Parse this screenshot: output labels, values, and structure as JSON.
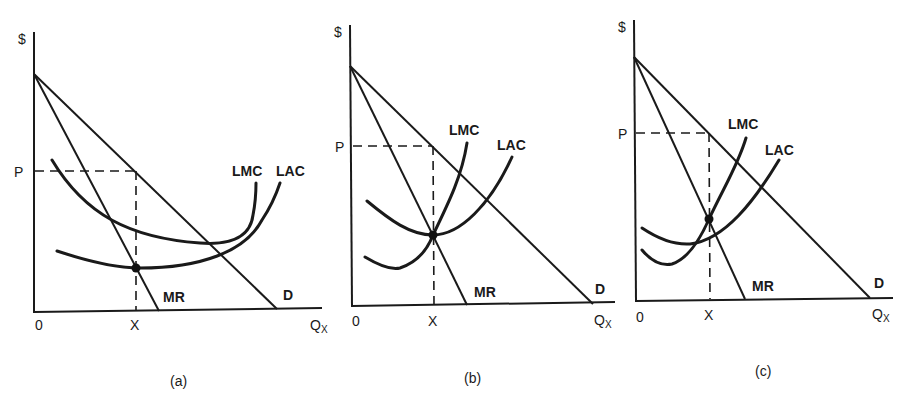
{
  "figure": {
    "panels": [
      {
        "caption": "(a)",
        "y_axis_label": "$",
        "x_axis_label": "Q",
        "x_axis_subscript": "X",
        "origin_label": "0",
        "price_label": "P",
        "quantity_label": "X",
        "curves": {
          "demand": "D",
          "marginal_revenue": "MR",
          "long_run_marginal_cost": "LMC",
          "long_run_average_cost": "LAC"
        }
      },
      {
        "caption": "(b)",
        "y_axis_label": "$",
        "x_axis_label": "Q",
        "x_axis_subscript": "X",
        "origin_label": "0",
        "price_label": "P",
        "quantity_label": "X",
        "curves": {
          "demand": "D",
          "marginal_revenue": "MR",
          "long_run_marginal_cost": "LMC",
          "long_run_average_cost": "LAC"
        }
      },
      {
        "caption": "(c)",
        "y_axis_label": "$",
        "x_axis_label": "Q",
        "x_axis_subscript": "X",
        "origin_label": "0",
        "price_label": "P",
        "quantity_label": "X",
        "curves": {
          "demand": "D",
          "marginal_revenue": "MR",
          "long_run_marginal_cost": "LMC",
          "long_run_average_cost": "LAC"
        }
      }
    ]
  }
}
